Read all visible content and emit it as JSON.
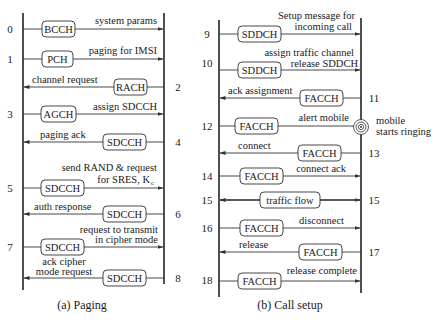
{
  "panel_a": {
    "caption": "(a) Paging",
    "messages": [
      {
        "num": "0",
        "channel": "BCCH",
        "label1": "system params",
        "label2": "",
        "dir": "right"
      },
      {
        "num": "1",
        "channel": "PCH",
        "label1": "paging for IMSI",
        "label2": "",
        "dir": "right"
      },
      {
        "num": "2",
        "channel": "RACH",
        "label1": "channel request",
        "label2": "",
        "dir": "left"
      },
      {
        "num": "3",
        "channel": "AGCH",
        "label1": "assign SDCCH",
        "label2": "",
        "dir": "right"
      },
      {
        "num": "4",
        "channel": "SDCCH",
        "label1": "paging ack",
        "label2": "",
        "dir": "left"
      },
      {
        "num": "5",
        "channel": "SDCCH",
        "label1": "send RAND & request",
        "label2": "for SRES, K",
        "label2_sub": "c",
        "dir": "right"
      },
      {
        "num": "6",
        "channel": "SDCCH",
        "label1": "auth response",
        "label2": "",
        "dir": "left"
      },
      {
        "num": "7",
        "channel": "SDCCH",
        "label1": "request to transmit",
        "label2": "in cipher mode",
        "dir": "right"
      },
      {
        "num": "8",
        "channel": "SDCCH",
        "label1": "ack cipher",
        "label2": "mode request",
        "dir": "left"
      }
    ]
  },
  "panel_b": {
    "caption": "(b) Call setup",
    "ringing_note": [
      "mobile",
      "starts ringing"
    ],
    "messages": [
      {
        "num": "9",
        "channel": "SDDCH",
        "label1": "Setup message for",
        "label2": "incoming call",
        "dir": "right"
      },
      {
        "num": "10",
        "channel": "SDDCH",
        "label1": "assign traffic channel",
        "label2": "release SDDCH",
        "dir": "right"
      },
      {
        "num": "11",
        "channel": "FACCH",
        "label1": "ack assignment",
        "label2": "",
        "dir": "left"
      },
      {
        "num": "12",
        "channel": "FACCH",
        "label1": "alert mobile",
        "label2": "",
        "dir": "right"
      },
      {
        "num": "13",
        "channel": "FACCH",
        "label1": "connect",
        "label2": "",
        "dir": "left"
      },
      {
        "num": "14",
        "channel": "FACCH",
        "label1": "connect ack",
        "label2": "",
        "dir": "right"
      },
      {
        "num": "15",
        "channel": "traffic flow",
        "label1": "",
        "label2": "",
        "dir": "both"
      },
      {
        "num": "16",
        "channel": "FACCH",
        "label1": "disconnect",
        "label2": "",
        "dir": "right"
      },
      {
        "num": "17",
        "channel": "FACCH",
        "label1": "release",
        "label2": "",
        "dir": "left"
      },
      {
        "num": "18",
        "channel": "FACCH",
        "label1": "release complete",
        "label2": "",
        "dir": "right"
      }
    ]
  }
}
